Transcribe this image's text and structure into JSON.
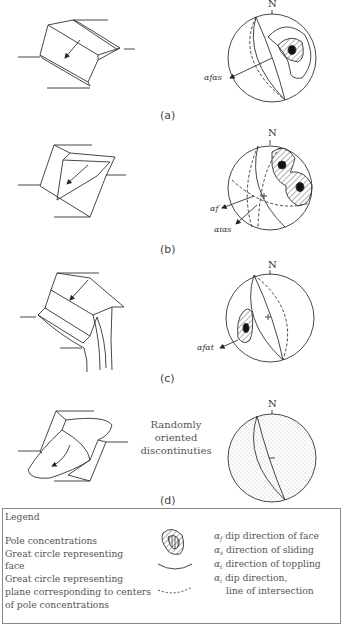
{
  "panels": [
    {
      "id": "a",
      "caption": "(a)",
      "north_label": "N",
      "direction_label": "αfαs",
      "mode": "plane failure"
    },
    {
      "id": "b",
      "caption": "(b)",
      "north_label": "N",
      "direction_labels": [
        "αf",
        "αiαs"
      ],
      "mode": "wedge failure"
    },
    {
      "id": "c",
      "caption": "(c)",
      "north_label": "N",
      "direction_label": "αfαt",
      "mode": "toppling failure"
    },
    {
      "id": "d",
      "caption": "(d)",
      "north_label": "N",
      "annotation_line1": "Randomly oriented",
      "annotation_line2": "discontinuties",
      "mode": "circular failure"
    }
  ],
  "legend": {
    "title": "Legend",
    "items_left": [
      {
        "label": "Pole concentrations",
        "symbol": "hatched-contour"
      },
      {
        "label_line1": "Great circle representing",
        "label_line2": "face",
        "symbol": "solid-arc"
      },
      {
        "label_line1": "Great circle representing",
        "label_line2": "plane corresponding to centers",
        "label_line3": "of pole concentrations",
        "symbol": "dashed-arc"
      }
    ],
    "items_right": [
      {
        "symbol": "α",
        "sub": "f",
        "label": "dip direction of face"
      },
      {
        "symbol": "α",
        "sub": "s",
        "label": "direction of sliding"
      },
      {
        "symbol": "α",
        "sub": "t",
        "label": "direction of toppling"
      },
      {
        "symbol": "α",
        "sub": "i",
        "label_line1": "dip direction,",
        "label_line2": "line of intersection"
      }
    ]
  }
}
